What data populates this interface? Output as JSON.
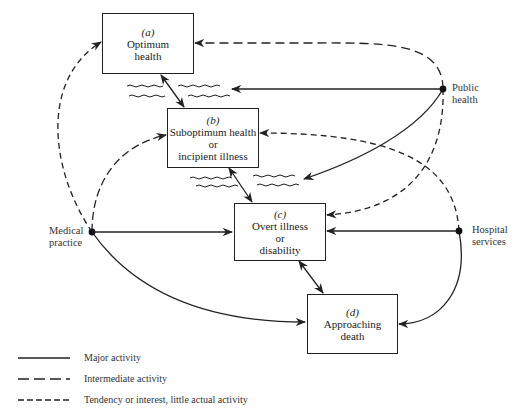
{
  "boxes": [
    {
      "id": "a",
      "tag": "(a)",
      "lines": [
        "Optimum",
        "health"
      ]
    },
    {
      "id": "b",
      "tag": "(b)",
      "lines": [
        "Suboptimum health",
        "or",
        "incipient illness"
      ]
    },
    {
      "id": "c",
      "tag": "(c)",
      "lines": [
        "Overt illness",
        "or",
        "disability"
      ]
    },
    {
      "id": "d",
      "tag": "(d)",
      "lines": [
        "Approaching",
        "death"
      ]
    }
  ],
  "nodes": {
    "public_health": {
      "line1": "Public",
      "line2": "health"
    },
    "medical_practice": {
      "line1": "Medical",
      "line2": "practice"
    },
    "hospital_services": {
      "line1": "Hospital",
      "line2": "services"
    }
  },
  "legend": [
    {
      "style": "solid",
      "label": "Major activity"
    },
    {
      "style": "long-dash",
      "label": "Intermediate activity"
    },
    {
      "style": "short-dash",
      "label": "Tendency or interest, little actual activity"
    }
  ],
  "edges": [
    {
      "from": "public_health",
      "to": "a",
      "style": "long-dash"
    },
    {
      "from": "public_health",
      "to": "a-b transition",
      "style": "solid"
    },
    {
      "from": "public_health",
      "to": "b-c transition",
      "style": "solid"
    },
    {
      "from": "public_health",
      "to": "c",
      "style": "short-dash"
    },
    {
      "from": "medical_practice",
      "to": "a",
      "style": "short-dash"
    },
    {
      "from": "medical_practice",
      "to": "b",
      "style": "long-dash"
    },
    {
      "from": "medical_practice",
      "to": "c",
      "style": "solid"
    },
    {
      "from": "medical_practice",
      "to": "d",
      "style": "solid"
    },
    {
      "from": "hospital_services",
      "to": "b",
      "style": "short-dash"
    },
    {
      "from": "hospital_services",
      "to": "c",
      "style": "solid"
    },
    {
      "from": "hospital_services",
      "to": "d",
      "style": "solid"
    },
    {
      "from": "a",
      "to": "b",
      "style": "solid",
      "bidirectional": true
    },
    {
      "from": "b",
      "to": "c",
      "style": "solid",
      "bidirectional": true
    },
    {
      "from": "c",
      "to": "d",
      "style": "solid",
      "bidirectional": true
    }
  ],
  "colors": {
    "ink": "#222222",
    "background": "#ffffff"
  }
}
